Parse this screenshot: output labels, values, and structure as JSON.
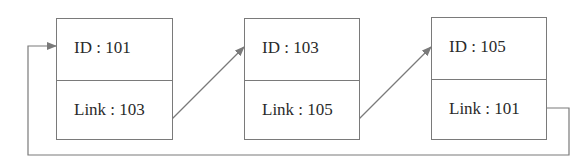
{
  "diagram": {
    "type": "circular-linked-list",
    "nodes": [
      {
        "id_label": "ID : 101",
        "link_label": "Link : 103"
      },
      {
        "id_label": "ID : 103",
        "link_label": "Link : 105"
      },
      {
        "id_label": "ID : 105",
        "link_label": "Link : 101"
      }
    ],
    "edges": [
      {
        "from": "101",
        "to": "103"
      },
      {
        "from": "103",
        "to": "105"
      },
      {
        "from": "105",
        "to": "101"
      }
    ],
    "colors": {
      "stroke": "#7a7a7a",
      "text": "#2a2a2a",
      "background": "#ffffff"
    }
  }
}
